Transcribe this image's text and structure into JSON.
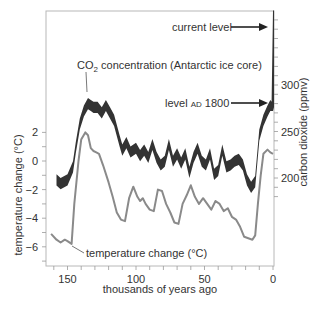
{
  "chart_data": {
    "type": "line",
    "title": "",
    "xlabel": "thousands of years ago",
    "ylabel_left": "temperature change (°C)",
    "ylabel_right": "carbon dioxide (ppmv)",
    "x_ticks": [
      "150",
      "100",
      "50",
      "0"
    ],
    "x_tick_values": [
      150,
      100,
      50,
      0
    ],
    "xlim": [
      162,
      0
    ],
    "y_left_ticks": [
      "2",
      "0",
      "-2",
      "-4",
      "-6"
    ],
    "y_left_tick_values": [
      2,
      0,
      -2,
      -4,
      -6
    ],
    "ylim_left": [
      -7.4,
      10.4
    ],
    "y_right_ticks": [
      "300",
      "250",
      "200"
    ],
    "y_right_tick_values": [
      300,
      250,
      200
    ],
    "ylim_right": [
      106,
      380
    ],
    "grid": false,
    "annotations": {
      "co2_label": "CO₂ concentration (Antarctic ice core)",
      "temp_label": "temperature change (°C)",
      "current_level": "current level",
      "level_1800": "level AD 1800"
    },
    "series": [
      {
        "name": "CO₂ concentration (Antarctic ice core)",
        "axis": "right",
        "color": "#333333",
        "style": "band",
        "x": [
          158,
          155,
          150,
          146,
          144,
          141,
          138,
          135,
          133,
          131,
          128,
          125,
          122,
          119,
          116,
          112,
          110,
          107,
          104,
          100,
          97,
          94,
          91,
          88,
          85,
          82,
          79,
          76,
          73,
          70,
          67,
          64,
          61,
          58,
          55,
          52,
          49,
          46,
          43,
          40,
          37,
          34,
          31,
          28,
          25,
          22,
          19,
          16,
          13,
          10,
          7,
          4,
          2,
          1,
          0
        ],
        "values": [
          198,
          194,
          198,
          212,
          232,
          258,
          272,
          280,
          278,
          276,
          276,
          270,
          278,
          270,
          262,
          240,
          230,
          238,
          228,
          232,
          224,
          230,
          222,
          236,
          222,
          214,
          218,
          236,
          218,
          226,
          216,
          226,
          206,
          222,
          232,
          218,
          214,
          226,
          204,
          208,
          230,
          212,
          214,
          218,
          220,
          214,
          198,
          190,
          196,
          246,
          262,
          272,
          278,
          282,
          380
        ]
      },
      {
        "name": "temperature change (°C)",
        "axis": "left",
        "color": "#8a8a8a",
        "style": "line",
        "x": [
          162,
          158,
          155,
          152,
          150,
          147,
          145,
          142,
          140,
          137,
          135,
          133,
          131,
          129,
          127,
          124,
          120,
          117,
          114,
          111,
          108,
          105,
          102,
          99,
          97,
          95,
          93,
          90,
          87,
          84,
          81,
          78,
          75,
          72,
          69,
          66,
          63,
          60,
          57,
          54,
          51,
          48,
          45,
          42,
          39,
          36,
          33,
          30,
          27,
          24,
          21,
          18,
          15,
          13,
          11,
          9,
          7,
          4,
          2,
          0
        ],
        "values": [
          -5.1,
          -5.5,
          -5.7,
          -5.5,
          -5.6,
          -5.8,
          -3.0,
          0.0,
          1.5,
          2.0,
          1.8,
          0.9,
          0.7,
          0.6,
          0.5,
          -0.3,
          -1.5,
          -2.5,
          -3.6,
          -4.1,
          -4.2,
          -2.6,
          -1.8,
          -2.5,
          -2.8,
          -2.6,
          -3.0,
          -3.4,
          -3.5,
          -2.0,
          -2.1,
          -3.0,
          -3.6,
          -4.3,
          -4.4,
          -3.0,
          -2.4,
          -1.7,
          -2.5,
          -3.0,
          -2.6,
          -3.0,
          -3.4,
          -2.8,
          -3.0,
          -3.5,
          -3.3,
          -3.9,
          -4.1,
          -4.6,
          -5.3,
          -5.4,
          -5.5,
          -5.2,
          -3.0,
          -1.0,
          0.5,
          0.8,
          0.6,
          0.5
        ]
      }
    ]
  }
}
